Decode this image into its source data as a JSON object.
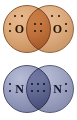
{
  "figure": {
    "background_color": "#ffffff",
    "width": 77,
    "height": 120
  },
  "diagrams": [
    {
      "id": "o2",
      "name": "oxygen-molecule",
      "molecule_label": "O2",
      "atom_symbol": "O",
      "left_atom_symbol": "O",
      "right_atom_symbol": "O",
      "circle_fill_color": "#dca878",
      "circle_stroke_color": "#8d5a33",
      "dot_color": "#1d1207",
      "bond_type": "double",
      "shared_electron_pairs": 2,
      "shared_electron_count": 4,
      "lone_pairs_per_atom": 2,
      "valence_electrons_per_atom": 6,
      "left_lone_pair_positions": [
        "left",
        "top"
      ],
      "right_lone_pair_positions": [
        "right",
        "top"
      ]
    },
    {
      "id": "n2",
      "name": "nitrogen-molecule",
      "molecule_label": "N2",
      "atom_symbol": "N",
      "left_atom_symbol": "N",
      "right_atom_symbol": "N",
      "circle_fill_color": "#9ba1c0",
      "circle_stroke_color": "#4a4f70",
      "dot_color": "#0d0f24",
      "bond_type": "triple",
      "shared_electron_pairs": 3,
      "shared_electron_count": 6,
      "lone_pairs_per_atom": 1,
      "valence_electrons_per_atom": 5,
      "left_lone_pair_positions": [
        "left"
      ],
      "right_lone_pair_positions": [
        "right"
      ]
    }
  ]
}
